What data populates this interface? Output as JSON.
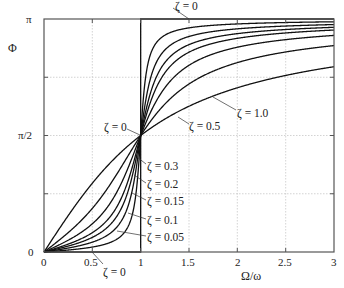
{
  "chart_data": {
    "type": "line",
    "title": "",
    "xlabel": "Ω/ω",
    "ylabel": "Φ",
    "xlim": [
      0,
      3
    ],
    "ylim": [
      0,
      3.14159265
    ],
    "grid": true,
    "x_ticks": [
      {
        "value": 0,
        "label": "0"
      },
      {
        "value": 0.5,
        "label": "0.5"
      },
      {
        "value": 1,
        "label": "1"
      },
      {
        "value": 1.5,
        "label": "1.5"
      },
      {
        "value": 2,
        "label": "2"
      },
      {
        "value": 2.5,
        "label": "2.5"
      },
      {
        "value": 3,
        "label": "3"
      }
    ],
    "y_ticks": [
      {
        "value": 0,
        "label": "0"
      },
      {
        "value": 0.785398,
        "label": ""
      },
      {
        "value": 1.570796,
        "label": "π/2"
      },
      {
        "value": 2.356194,
        "label": ""
      },
      {
        "value": 3.141593,
        "label": "π"
      }
    ],
    "formula": "Φ = atan2(2ζ(Ω/ω), 1 − (Ω/ω)²)",
    "series": [
      {
        "name": "ζ = 0",
        "zeta": 0,
        "points": [
          [
            0,
            0
          ],
          [
            1,
            0
          ],
          [
            1,
            3.14159
          ],
          [
            3,
            3.14159
          ]
        ]
      },
      {
        "name": "ζ = 0.05",
        "zeta": 0.05,
        "sample": {
          "x": [
            0.5,
            0.9,
            1,
            1.1,
            1.5,
            2,
            3
          ],
          "y": [
            0.07,
            0.47,
            1.57,
            2.65,
            3.06,
            3.08,
            3.1
          ]
        }
      },
      {
        "name": "ζ = 0.1",
        "zeta": 0.1,
        "sample": {
          "x": [
            0.5,
            0.9,
            1,
            1.1,
            1.5,
            2,
            3
          ],
          "y": [
            0.13,
            0.76,
            1.57,
            2.33,
            2.97,
            3.01,
            3.07
          ]
        }
      },
      {
        "name": "ζ = 0.15",
        "zeta": 0.15,
        "sample": {
          "x": [
            0.5,
            0.9,
            1,
            1.1,
            1.5,
            2,
            3
          ],
          "y": [
            0.2,
            0.96,
            1.57,
            2.11,
            2.89,
            2.94,
            3.03
          ]
        }
      },
      {
        "name": "ζ = 0.2",
        "zeta": 0.2,
        "sample": {
          "x": [
            0.5,
            0.9,
            1,
            1.1,
            1.5,
            2,
            3
          ],
          "y": [
            0.26,
            1.08,
            1.57,
            1.97,
            2.81,
            2.88,
            2.99
          ]
        }
      },
      {
        "name": "ζ = 0.3",
        "zeta": 0.3,
        "sample": {
          "x": [
            0.5,
            0.9,
            1,
            1.1,
            1.5,
            2,
            3
          ],
          "y": [
            0.38,
            1.23,
            1.57,
            1.88,
            2.65,
            2.76,
            2.92
          ]
        }
      },
      {
        "name": "ζ = 0.5",
        "zeta": 0.5,
        "sample": {
          "x": [
            0.5,
            0.9,
            1,
            1.1,
            1.5,
            2,
            3
          ],
          "y": [
            0.59,
            1.36,
            1.57,
            1.77,
            2.27,
            2.55,
            2.78
          ]
        }
      },
      {
        "name": "ζ = 1.0",
        "zeta": 1.0,
        "sample": {
          "x": [
            0.5,
            0.9,
            1,
            1.1,
            1.5,
            2,
            3
          ],
          "y": [
            0.93,
            1.46,
            1.57,
            1.67,
            1.97,
            2.21,
            2.5
          ]
        }
      }
    ],
    "annotations": [
      {
        "text": "ζ = 0",
        "target": "top step (Φ = π)"
      },
      {
        "text": "ζ = 0",
        "target": "crossing at Ω/ω = 1"
      },
      {
        "text": "ζ = 0",
        "target": "bottom step (Φ = 0)"
      },
      {
        "text": "ζ = 0.5"
      },
      {
        "text": "ζ = 1.0"
      },
      {
        "text": "ζ = 0.3"
      },
      {
        "text": "ζ = 0.2"
      },
      {
        "text": "ζ = 0.15"
      },
      {
        "text": "ζ = 0.1"
      },
      {
        "text": "ζ = 0.05"
      }
    ]
  },
  "labels": {
    "y_axis": "Φ",
    "x_axis": "Ω/ω",
    "y_pi": "π",
    "y_half_pi": "π/2",
    "y_zero": "0",
    "x0": "0",
    "x05": "0.5",
    "x1": "1",
    "x15": "1.5",
    "x2": "2",
    "x25": "2.5",
    "x3": "3",
    "zeta_top": "ζ = 0",
    "zeta_mid": "ζ = 0",
    "zeta_bottom": "ζ = 0",
    "zeta_05": "ζ = 0.5",
    "zeta_10": "ζ = 1.0",
    "zeta_03": "ζ = 0.3",
    "zeta_02": "ζ = 0.2",
    "zeta_015": "ζ = 0.15",
    "zeta_01": "ζ = 0.1",
    "zeta_005": "ζ = 0.05"
  },
  "zetas": [
    0.05,
    0.1,
    0.15,
    0.2,
    0.3,
    0.5,
    1.0
  ]
}
